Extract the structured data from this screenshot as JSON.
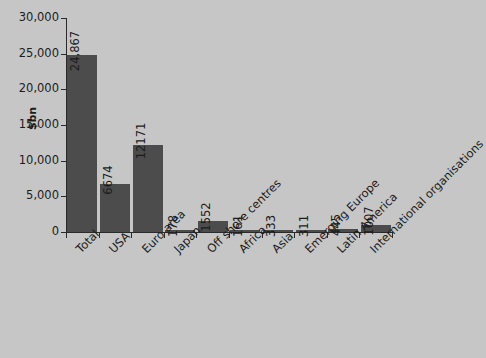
{
  "chart_data": {
    "type": "bar",
    "title": "",
    "subtitle": "",
    "xlabel": "",
    "ylabel": "$bn",
    "ylim": [
      0,
      30000
    ],
    "grid": false,
    "legend": false,
    "legend_position": "none",
    "y_ticks": [
      "0",
      "5,000",
      "10,000",
      "15,000",
      "20,000",
      "25,000",
      "30,000"
    ],
    "y_tick_values": [
      0,
      5000,
      10000,
      15000,
      20000,
      25000,
      30000
    ],
    "categories": [
      "Total",
      "USA",
      "Euro area",
      "Japan",
      "Off shore centres",
      "Africa",
      "Asia",
      "Emerging Europe",
      "Latin America",
      "International organisations"
    ],
    "values": [
      24867,
      6674,
      12171,
      178,
      1552,
      161,
      333,
      311,
      445,
      1007
    ],
    "value_labels": [
      "24,867",
      "6674",
      "12171",
      "178",
      "1552",
      "161",
      "333",
      "311",
      "445",
      "1007"
    ],
    "colors": {
      "bar": "#4c4c4c",
      "background": "#c6c6c6",
      "axis": "#2a2a2a",
      "text": "#1c1c1c"
    }
  }
}
